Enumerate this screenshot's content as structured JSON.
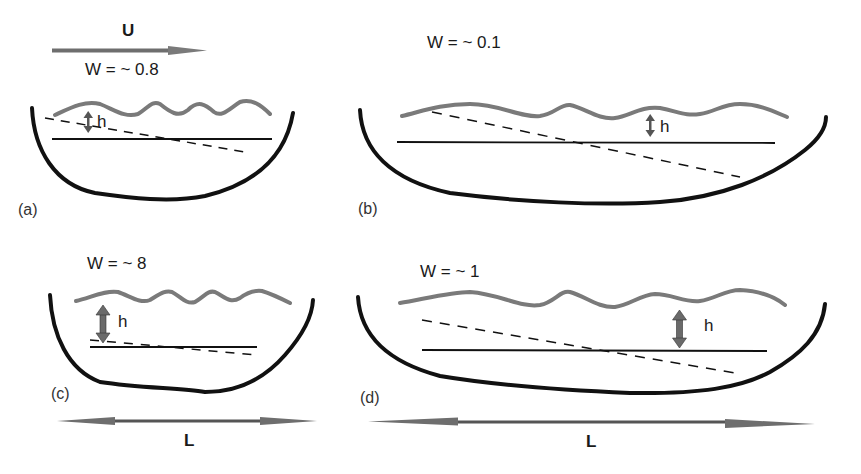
{
  "figure": {
    "colors": {
      "basin": "#111111",
      "surface_wave": "#7a7a7a",
      "arrow_fill": "#777777",
      "solid_line": "#111111",
      "dashed_line": "#111111",
      "background": "#ffffff"
    },
    "flow_arrow": {
      "label": "U",
      "direction": "right"
    },
    "length_arrow_label": "L",
    "height_label": "h",
    "panels": [
      {
        "id": "(a)",
        "w_label": "W = ~ 0.8",
        "h_label": "h"
      },
      {
        "id": "(b)",
        "w_label": "W = ~ 0.1",
        "h_label": "h"
      },
      {
        "id": "(c)",
        "w_label": "W = ~ 8",
        "h_label": "h"
      },
      {
        "id": "(d)",
        "w_label": "W =  ~ 1",
        "h_label": "h"
      }
    ],
    "scale_arrows": [
      {
        "label": "L",
        "under_panel": "(c)"
      },
      {
        "label": "L",
        "under_panel": "(d)"
      }
    ]
  }
}
